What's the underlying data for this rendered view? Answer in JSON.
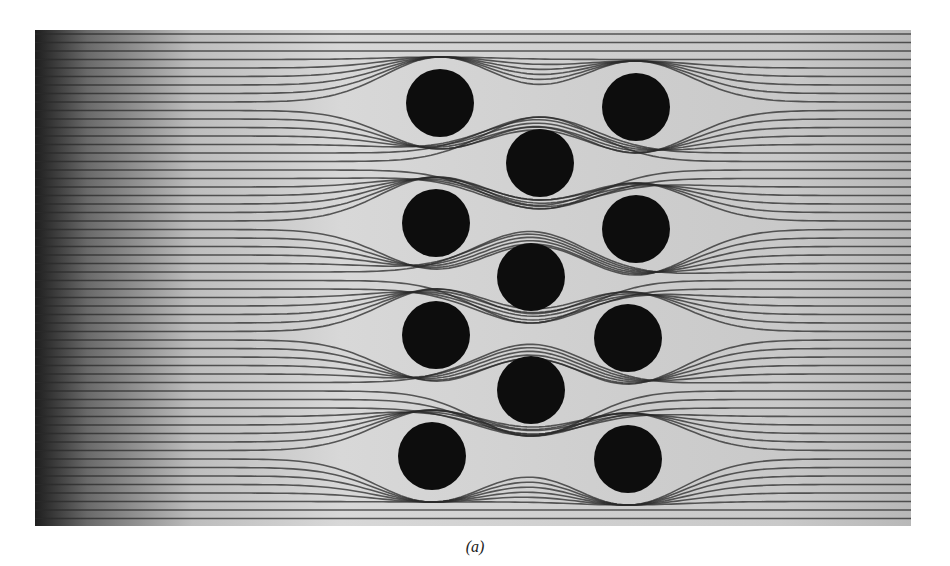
{
  "figure": {
    "caption": "(a)",
    "cylinders": [
      {
        "cx": 405,
        "cy": 73,
        "r": 34
      },
      {
        "cx": 601,
        "cy": 77,
        "r": 34
      },
      {
        "cx": 505,
        "cy": 133,
        "r": 34
      },
      {
        "cx": 401,
        "cy": 193,
        "r": 34
      },
      {
        "cx": 601,
        "cy": 199,
        "r": 34
      },
      {
        "cx": 496,
        "cy": 247,
        "r": 34
      },
      {
        "cx": 401,
        "cy": 305,
        "r": 34
      },
      {
        "cx": 593,
        "cy": 308,
        "r": 34
      },
      {
        "cx": 496,
        "cy": 360,
        "r": 34
      },
      {
        "cx": 397,
        "cy": 426,
        "r": 34
      },
      {
        "cx": 593,
        "cy": 429,
        "r": 34
      }
    ]
  }
}
